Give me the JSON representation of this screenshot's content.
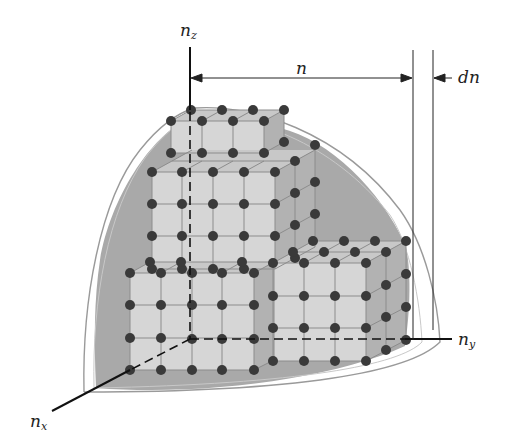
{
  "figure": {
    "labels": {
      "nz": {
        "base": "n",
        "sub": "z"
      },
      "ny": {
        "base": "n",
        "sub": "y"
      },
      "nx": {
        "base": "n",
        "sub": "x"
      },
      "n": "n",
      "dn": "dn"
    },
    "colors": {
      "dot": "#3a3a3a",
      "edge": "#8a8a8a",
      "cube_front": "#d4d4d4",
      "cube_side": "#b4b4b4",
      "cube_top": "#c6c6c6",
      "octant_fill": "#a8a8a8",
      "shell_line": "#9a9a9a",
      "axis": "#111111"
    }
  }
}
